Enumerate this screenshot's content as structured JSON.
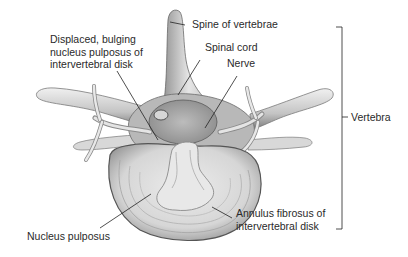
{
  "diagram": {
    "labels": {
      "spine_of_vertebrae": "Spine of vertebrae",
      "displaced_nucleus": {
        "line1": "Displaced, bulging",
        "line2": "nucleus pulposus of",
        "line3": "intervertebral disk"
      },
      "spinal_cord": "Spinal cord",
      "nerve": "Nerve",
      "vertebra": "Vertebra",
      "nucleus_pulposus": "Nucleus pulposus",
      "annulus_fibrosus": {
        "line1": "Annulus fibrosus of",
        "line2": "intervertebral disk"
      }
    },
    "colors": {
      "text": "#2a2a2a",
      "leader_line": "#222222",
      "bone_light": "#e6e6e6",
      "bone_mid": "#bdbdbd",
      "bone_dark": "#6e6e6e",
      "disk_fill": "#dcdcdc",
      "cord_fill": "#a8a8a8"
    }
  }
}
